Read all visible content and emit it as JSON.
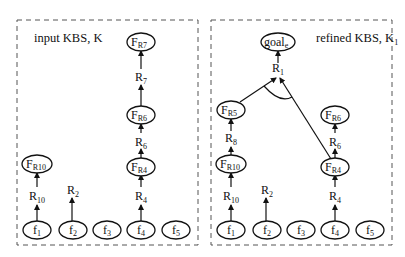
{
  "panels": [
    {
      "title": "input KBS, K",
      "title_main": "input KBS, ",
      "title_var": "K",
      "title_sub": "",
      "nodes": {
        "FR7": {
          "main": "F",
          "sub": "R7"
        },
        "FR6": {
          "main": "F",
          "sub": "R6"
        },
        "FR4": {
          "main": "F",
          "sub": "R4"
        },
        "FR10": {
          "main": "F",
          "sub": "R10"
        },
        "f1": {
          "main": "f",
          "sub": "1"
        },
        "f2": {
          "main": "f",
          "sub": "2"
        },
        "f3": {
          "main": "f",
          "sub": "3"
        },
        "f4": {
          "main": "f",
          "sub": "4"
        },
        "f5": {
          "main": "f",
          "sub": "5"
        }
      },
      "rules": {
        "R7": {
          "main": "R",
          "sub": "7"
        },
        "R6": {
          "main": "R",
          "sub": "6"
        },
        "R4": {
          "main": "R",
          "sub": "4"
        },
        "R10": {
          "main": "R",
          "sub": "10"
        },
        "R2": {
          "main": "R",
          "sub": "2"
        }
      }
    },
    {
      "title": "refined KBS, K1",
      "title_main": "refined KBS, ",
      "title_var": "K",
      "title_sub": "1",
      "nodes": {
        "goal": {
          "main": "goal",
          "sub": "e"
        },
        "FR5": {
          "main": "F",
          "sub": "R5"
        },
        "FR6": {
          "main": "F",
          "sub": "R6"
        },
        "FR4": {
          "main": "F",
          "sub": "R4"
        },
        "FR10": {
          "main": "F",
          "sub": "R10"
        },
        "f1": {
          "main": "f",
          "sub": "1"
        },
        "f2": {
          "main": "f",
          "sub": "2"
        },
        "f3": {
          "main": "f",
          "sub": "3"
        },
        "f4": {
          "main": "f",
          "sub": "4"
        },
        "f5": {
          "main": "f",
          "sub": "5"
        }
      },
      "rules": {
        "R1": {
          "main": "R",
          "sub": "1"
        },
        "R8": {
          "main": "R",
          "sub": "8"
        },
        "R6": {
          "main": "R",
          "sub": "6"
        },
        "R4": {
          "main": "R",
          "sub": "4"
        },
        "R10": {
          "main": "R",
          "sub": "10"
        },
        "R2": {
          "main": "R",
          "sub": "2"
        }
      }
    }
  ]
}
